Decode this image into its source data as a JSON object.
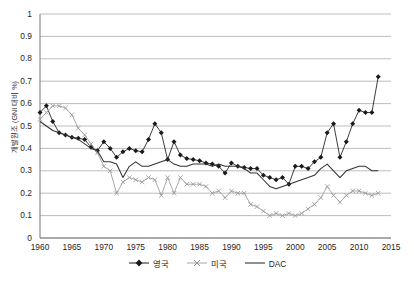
{
  "chart_data": {
    "type": "line",
    "title": "",
    "xlabel": "",
    "ylabel": "개발원조 (GNI 대비 %)",
    "xlim": [
      1960,
      2015
    ],
    "ylim": [
      0,
      1
    ],
    "grid": true,
    "legend_position": "bottom",
    "xticks": [
      "1960",
      "1965",
      "1970",
      "1975",
      "1980",
      "1985",
      "1990",
      "1995",
      "2000",
      "2005",
      "2010",
      "2015"
    ],
    "yticks": [
      "0",
      "0.1",
      "0.2",
      "0.3",
      "0.4",
      "0.5",
      "0.6",
      "0.7",
      "0.8",
      "0.9",
      "1"
    ],
    "x": [
      1960,
      1961,
      1962,
      1963,
      1964,
      1965,
      1966,
      1967,
      1968,
      1969,
      1970,
      1971,
      1972,
      1973,
      1974,
      1975,
      1976,
      1977,
      1978,
      1979,
      1980,
      1981,
      1982,
      1983,
      1984,
      1985,
      1986,
      1987,
      1988,
      1989,
      1990,
      1991,
      1992,
      1993,
      1994,
      1995,
      1996,
      1997,
      1998,
      1999,
      2000,
      2001,
      2002,
      2003,
      2004,
      2005,
      2006,
      2007,
      2008,
      2009,
      2010,
      2011,
      2012,
      2013
    ],
    "series": [
      {
        "name": "영국",
        "marker": "diamond",
        "color": "#1a1a1a",
        "values": [
          0.56,
          0.59,
          0.52,
          0.47,
          0.46,
          0.45,
          0.445,
          0.44,
          0.405,
          0.39,
          0.43,
          0.4,
          0.36,
          0.385,
          0.4,
          0.39,
          0.385,
          0.44,
          0.51,
          0.47,
          0.35,
          0.43,
          0.37,
          0.355,
          0.35,
          0.345,
          0.335,
          0.33,
          0.32,
          0.29,
          0.335,
          0.32,
          0.315,
          0.31,
          0.31,
          0.28,
          0.27,
          0.26,
          0.27,
          0.24,
          0.32,
          0.32,
          0.31,
          0.34,
          0.36,
          0.47,
          0.51,
          0.36,
          0.43,
          0.51,
          0.57,
          0.56,
          0.56,
          0.72
        ]
      },
      {
        "name": "미국",
        "marker": "x",
        "color": "#9a9a9a",
        "values": [
          0.53,
          0.56,
          0.59,
          0.59,
          0.58,
          0.55,
          0.49,
          0.46,
          0.42,
          0.38,
          0.32,
          0.3,
          0.2,
          0.25,
          0.27,
          0.26,
          0.25,
          0.27,
          0.26,
          0.19,
          0.27,
          0.2,
          0.27,
          0.24,
          0.24,
          0.24,
          0.23,
          0.2,
          0.21,
          0.18,
          0.21,
          0.2,
          0.2,
          0.15,
          0.14,
          0.12,
          0.1,
          0.11,
          0.1,
          0.11,
          0.1,
          0.11,
          0.13,
          0.15,
          0.18,
          0.23,
          0.19,
          0.16,
          0.19,
          0.21,
          0.21,
          0.2,
          0.19,
          0.2
        ]
      },
      {
        "name": "DAC",
        "marker": "none",
        "color": "#333333",
        "values": [
          0.52,
          0.5,
          0.48,
          0.47,
          0.46,
          0.45,
          0.44,
          0.42,
          0.4,
          0.39,
          0.34,
          0.34,
          0.33,
          0.27,
          0.32,
          0.34,
          0.32,
          0.32,
          0.33,
          0.34,
          0.35,
          0.33,
          0.32,
          0.32,
          0.33,
          0.33,
          0.33,
          0.32,
          0.33,
          0.32,
          0.32,
          0.32,
          0.31,
          0.29,
          0.29,
          0.26,
          0.23,
          0.22,
          0.23,
          0.24,
          0.25,
          0.26,
          0.27,
          0.28,
          0.31,
          0.33,
          0.3,
          0.27,
          0.3,
          0.31,
          0.32,
          0.32,
          0.3,
          0.3
        ]
      }
    ],
    "legend": [
      "영국",
      "미국",
      "DAC"
    ]
  }
}
